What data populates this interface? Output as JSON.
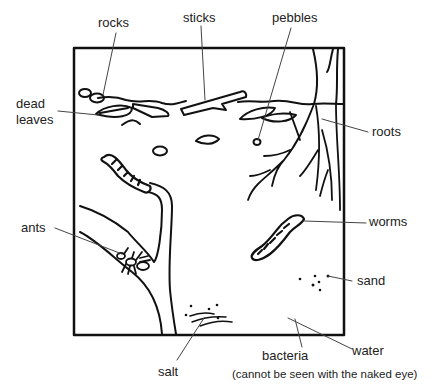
{
  "diagram": {
    "labels": {
      "rocks": "rocks",
      "sticks": "sticks",
      "pebbles": "pebbles",
      "dead_leaves_line1": "dead",
      "dead_leaves_line2": "leaves",
      "roots": "roots",
      "ants": "ants",
      "worms": "worms",
      "sand": "sand",
      "salt": "salt",
      "bacteria": "bacteria",
      "water": "water",
      "bacteria_note": "(cannot be seen with the naked eye)"
    },
    "colors": {
      "stroke": "#111111",
      "leader": "#444444",
      "text": "#222222",
      "background": "#ffffff"
    }
  }
}
